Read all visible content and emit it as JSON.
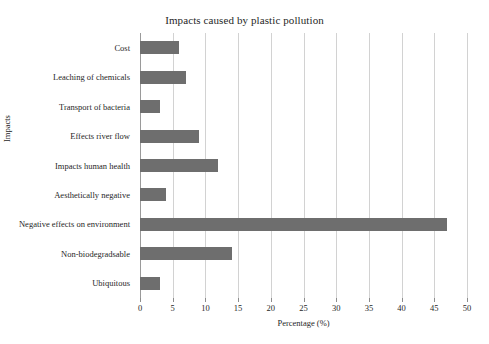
{
  "chart_data": {
    "type": "bar",
    "orientation": "horizontal",
    "title": "Impacts caused by plastic pollution",
    "xlabel": "Percentage (%)",
    "ylabel": "Impacts",
    "categories": [
      "Cost",
      "Leaching of chemicals",
      "Transport of bacteria",
      "Effects river flow",
      "Impacts human health",
      "Aesthetically negative",
      "Negative effects on environment",
      "Non-biodegradsable",
      "Ubiquitous"
    ],
    "values": [
      6,
      7,
      3,
      9,
      12,
      4,
      47,
      14,
      3
    ],
    "xlim": [
      0,
      50
    ],
    "xticks": [
      0,
      5,
      10,
      15,
      20,
      25,
      30,
      35,
      40,
      45,
      50
    ],
    "xticklabels": [
      "0",
      "5",
      "10",
      "15",
      "20",
      "25",
      "30",
      "35",
      "40",
      "45",
      "50"
    ],
    "grid": "vertical",
    "legend": "none",
    "bar_color": "#6e6e6e",
    "gridline_color": "#d2d2d2",
    "axis_color": "#9a9a9a",
    "background_color": "#ffffff"
  }
}
